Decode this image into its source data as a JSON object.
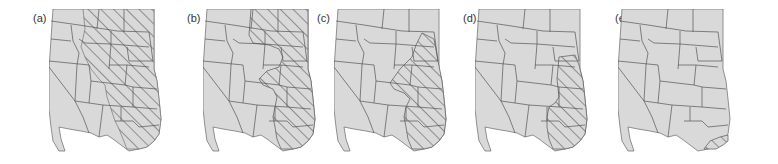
{
  "figure": {
    "type": "map-series",
    "region": "Western and Central United States",
    "colors": {
      "land": "#d9d9d9",
      "border": "#555555",
      "hatch": "#444444",
      "outline": "#666666"
    },
    "panels": [
      {
        "label": "(a)",
        "hatched_extent": "Great Plains east of Rockies, from northern border to Texas"
      },
      {
        "label": "(b)",
        "hatched_extent": "Eastern plains, reduced band from Dakotas to Texas"
      },
      {
        "label": "(c)",
        "hatched_extent": "Central-eastern plains from South Dakota to Texas"
      },
      {
        "label": "(d)",
        "hatched_extent": "Narrow eastern band from South Dakota/Nebraska to Texas"
      },
      {
        "label": "(e)",
        "hatched_extent": "Small area in southeastern Texas"
      }
    ]
  }
}
